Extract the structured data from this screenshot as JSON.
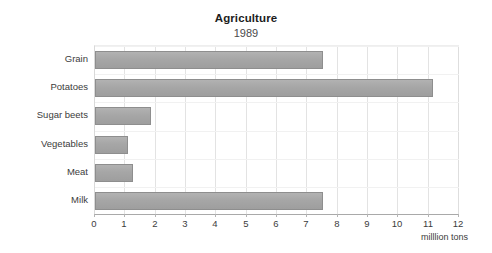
{
  "chart_data": {
    "type": "bar",
    "orientation": "horizontal",
    "title": "Agriculture",
    "subtitle": "1989",
    "categories": [
      "Grain",
      "Potatoes",
      "Sugar beets",
      "Vegetables",
      "Meat",
      "Milk"
    ],
    "values": [
      7.5,
      11.15,
      1.85,
      1.1,
      1.25,
      7.5
    ],
    "xlabel": "milllion tons",
    "ylabel": "",
    "xlim": [
      0,
      12
    ],
    "xticks": [
      0,
      1,
      2,
      3,
      4,
      5,
      6,
      7,
      8,
      9,
      10,
      11,
      12
    ],
    "xtick_labels": [
      "0",
      "1",
      "2",
      "3",
      "4",
      "5",
      "6",
      "7",
      "8",
      "9",
      "10",
      "11",
      "12"
    ],
    "grid": true,
    "grid_axis": "both",
    "legend": false,
    "legend_position": "none",
    "series": [
      {
        "name": "Production",
        "values": [
          7.5,
          11.15,
          1.85,
          1.1,
          1.25,
          7.5
        ]
      }
    ]
  },
  "style": {
    "background": "#ffffff",
    "bar_fill": "#a6a6a6",
    "bar_border": "#8e8e8e",
    "grid_color": "#e3e3e3",
    "axis_color": "#a9a9a9",
    "text_color": "#3c3c3c",
    "title_color": "#1d1d1d"
  }
}
